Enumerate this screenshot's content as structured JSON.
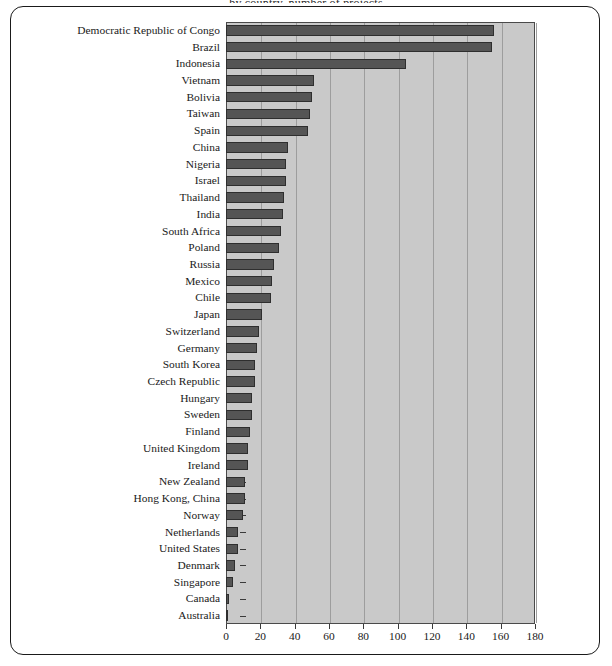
{
  "figure": {
    "title_fragment": "by country, number of projects",
    "frame_color": "#1a1a1a",
    "plot_background": "#c9c9c9",
    "bar_color": "#555555",
    "bar_edge_color": "#2e2e2e",
    "gridline_color": "#9d9d9d",
    "axis_color": "#3a3a3a"
  },
  "chart_data": {
    "type": "bar",
    "orientation": "horizontal",
    "title": "",
    "xlabel": "",
    "ylabel": "",
    "xlim": [
      0,
      180
    ],
    "xticks": [
      0,
      20,
      40,
      60,
      80,
      100,
      120,
      140,
      160,
      180
    ],
    "grid": true,
    "grid_axis": "x",
    "legend": null,
    "categories": [
      "Democratic Republic of Congo",
      "Brazil",
      "Indonesia",
      "Vietnam",
      "Bolivia",
      "Taiwan",
      "Spain",
      "China",
      "Nigeria",
      "Israel",
      "Thailand",
      "India",
      "South Africa",
      "Poland",
      "Russia",
      "Mexico",
      "Chile",
      "Japan",
      "Switzerland",
      "Germany",
      "South Korea",
      "Czech Republic",
      "Hungary",
      "Sweden",
      "Finland",
      "United Kingdom",
      "Ireland",
      "New Zealand",
      "Hong Kong, China",
      "Norway",
      "Netherlands",
      "United States",
      "Denmark",
      "Singapore",
      "Canada",
      "Australia"
    ],
    "values": [
      156,
      155,
      105,
      51,
      50,
      49,
      48,
      36,
      35,
      35,
      34,
      33,
      32,
      31,
      28,
      27,
      26,
      21,
      19,
      18,
      17,
      17,
      15,
      15,
      14,
      13,
      13,
      11,
      11,
      10,
      7,
      7,
      5,
      4,
      2,
      1
    ]
  }
}
